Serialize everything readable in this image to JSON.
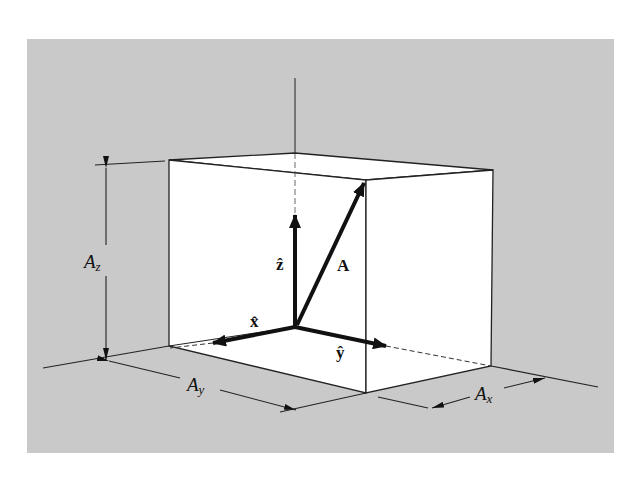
{
  "figure": {
    "colors": {
      "panel": "#c9c9c9",
      "box_face": "#ffffff",
      "ink": "#111111"
    },
    "labels": {
      "z_hat": "ẑ",
      "x_hat": "x̂",
      "y_hat": "ŷ",
      "vector_A": "A",
      "Az_main": "A",
      "Az_sub": "z",
      "Ay_main": "A",
      "Ay_sub": "y",
      "Ax_main": "A",
      "Ax_sub": "x"
    }
  }
}
